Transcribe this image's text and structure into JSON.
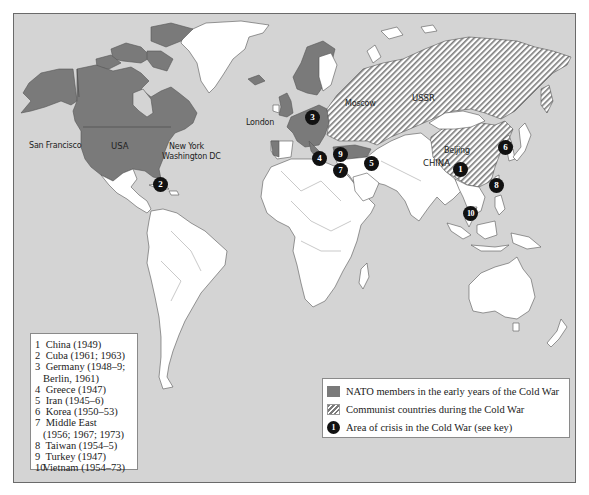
{
  "map": {
    "title": "Cold War world map",
    "colors": {
      "ocean": "#d4d4d4",
      "land": "#ffffff",
      "nato": "#7a7a7a",
      "communist_hatch": "#7a7a7a",
      "crisis_marker": "#111111",
      "border": "#555555"
    },
    "cities": {
      "san_francisco": "San Francisco",
      "new_york": "New York",
      "washington": "Washington DC",
      "london": "London",
      "moscow": "Moscow",
      "beijing": "Beijing"
    },
    "countries": {
      "usa": "USA",
      "ussr": "USSR",
      "china": "CHINA"
    },
    "crisis_markers": [
      {
        "id": "1",
        "label": "1"
      },
      {
        "id": "2",
        "label": "2"
      },
      {
        "id": "3",
        "label": "3"
      },
      {
        "id": "4",
        "label": "4"
      },
      {
        "id": "5",
        "label": "5"
      },
      {
        "id": "6",
        "label": "6"
      },
      {
        "id": "7",
        "label": "7"
      },
      {
        "id": "8",
        "label": "8"
      },
      {
        "id": "9",
        "label": "9"
      },
      {
        "id": "10",
        "label": "10"
      }
    ]
  },
  "key": {
    "items": [
      {
        "num": "1",
        "text": "China (1949)"
      },
      {
        "num": "2",
        "text": "Cuba (1961; 1963)"
      },
      {
        "num": "3",
        "text": "Germany (1948–9;",
        "cont": "Berlin, 1961)"
      },
      {
        "num": "4",
        "text": "Greece (1947)"
      },
      {
        "num": "5",
        "text": "Iran (1945–6)"
      },
      {
        "num": "6",
        "text": "Korea (1950–53)"
      },
      {
        "num": "7",
        "text": "Middle East",
        "cont": "(1956; 1967; 1973)"
      },
      {
        "num": "8",
        "text": "Taiwan (1954–5)"
      },
      {
        "num": "9",
        "text": "Turkey (1947)"
      },
      {
        "num": "10",
        "text": "Vietnam (1954–73)"
      }
    ]
  },
  "legend": {
    "nato": "NATO members in the early years of the Cold War",
    "communist": "Communist countries during the Cold War",
    "crisis": "Area of crisis in the Cold War (see key)",
    "crisis_symbol": "1"
  }
}
